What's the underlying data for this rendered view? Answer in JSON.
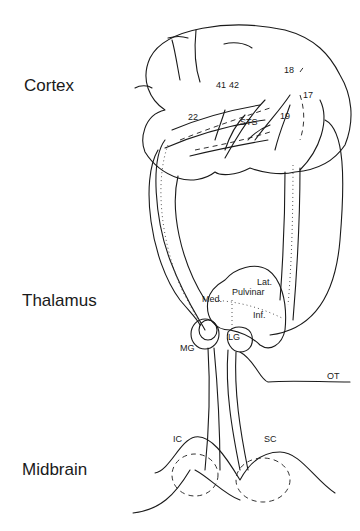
{
  "regions": {
    "cortex": "Cortex",
    "thalamus": "Thalamus",
    "midbrain": "Midbrain"
  },
  "cortex_areas": {
    "a41": "41",
    "a42": "42",
    "a22": "22",
    "a18": "18",
    "a17": "17",
    "a19": "19",
    "sts": "STS"
  },
  "thalamus_nuclei": {
    "pulvinar": "Pulvinar",
    "lat": "Lat.",
    "med": "Med.",
    "inf": "Inf.",
    "mg": "MG",
    "lg": "LG"
  },
  "midbrain_structures": {
    "ic": "IC",
    "sc": "SC",
    "ot": "OT"
  }
}
